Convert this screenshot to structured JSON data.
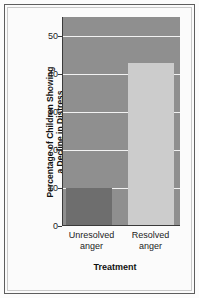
{
  "chart_data": {
    "type": "bar",
    "title": "",
    "categories": [
      "Unresolved anger",
      "Resolved anger"
    ],
    "values": [
      10,
      43
    ],
    "series": [
      {
        "name": "Percentage of Children Showing a Decline in Distress",
        "values": [
          10,
          43
        ]
      }
    ],
    "xlabel": "Treatment",
    "ylabel": "Percentage of Children Showing a Decline in Distress",
    "ylim": [
      0,
      55
    ],
    "ytick_values": [
      0,
      10,
      20,
      30,
      40,
      50
    ],
    "ytick_labels": [
      "0",
      "10",
      "20",
      "30",
      "40",
      "50"
    ],
    "grid": true,
    "grid_axis": "y",
    "legend": false,
    "bar_colors": [
      "#6e6e6e",
      "#cccccc"
    ],
    "plot_background": "#8f8f8f",
    "gridline_color": "#f2f2f2",
    "axis_color": "#3a3a3a",
    "figure_background": "#fbfbfb",
    "frame_color": "#5e5e5e"
  },
  "axes": {
    "y_title_line1": "Percentage of Children Showing",
    "y_title_line2": "a Decline in Distress",
    "x_title": "Treatment"
  },
  "category_labels": [
    {
      "line1": "Unresolved",
      "line2": "anger"
    },
    {
      "line1": "Resolved",
      "line2": "anger"
    }
  ]
}
